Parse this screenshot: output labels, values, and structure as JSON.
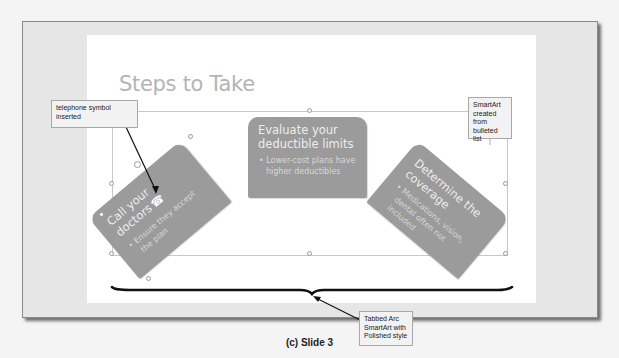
{
  "slide": {
    "title": "Steps to Take",
    "smartart": {
      "layout": "Tabbed Arc",
      "style": "Polished",
      "shapes": [
        {
          "heading": "Call your doctors",
          "icon": "telephone-icon",
          "icon_glyph": "☎",
          "bullet": "Ensure they accept the plan",
          "rotation": -40
        },
        {
          "heading": "Evaluate your deductible limits",
          "bullet": "Lower-cost plans have higher deductibles",
          "rotation": 0
        },
        {
          "heading": "Determine the coverage",
          "bullet": "Medications, vision, dental often not included",
          "rotation": 40
        }
      ]
    }
  },
  "callouts": {
    "telephone": "telephone symbol inserted",
    "smartart_source": "SmartArt created from bulleted list",
    "layout_style": "Tabbed Arc SmartArt with Polished style"
  },
  "caption": "(c) Slide 3",
  "colors": {
    "shape_fill": "#9b9b9b",
    "shape_text": "#ededed",
    "title_text": "#b4b4b4",
    "frame_bg": "#e6e6e6",
    "slide_bg": "#ffffff",
    "brace": "#111111"
  }
}
